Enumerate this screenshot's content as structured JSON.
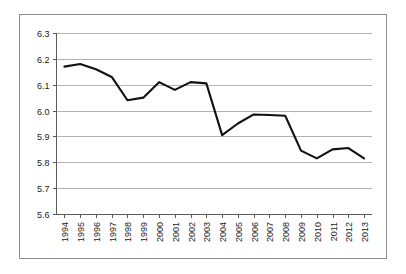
{
  "chart_data": {
    "type": "line",
    "title": "",
    "subtitle": "",
    "xlabel": "",
    "ylabel": "",
    "categories": [
      "1994",
      "1995",
      "1996",
      "1997",
      "1998",
      "1999",
      "2000",
      "2001",
      "2002",
      "2003",
      "2004",
      "2005",
      "2006",
      "2007",
      "2008",
      "2009",
      "2010",
      "2011",
      "2012",
      "2013"
    ],
    "values": [
      6.17,
      6.18,
      6.16,
      6.13,
      6.04,
      6.05,
      6.11,
      6.08,
      6.11,
      6.105,
      5.905,
      5.95,
      5.985,
      5.983,
      5.98,
      5.845,
      5.815,
      5.85,
      5.855,
      5.815
    ],
    "series": [
      {
        "name": "series-1",
        "color": "#111111",
        "values": [
          6.17,
          6.18,
          6.16,
          6.13,
          6.04,
          6.05,
          6.11,
          6.08,
          6.11,
          6.105,
          5.905,
          5.95,
          5.985,
          5.983,
          5.98,
          5.845,
          5.815,
          5.85,
          5.855,
          5.815
        ]
      }
    ],
    "ylim": [
      5.6,
      6.3
    ],
    "ytick_values": [
      6.3,
      6.2,
      6.1,
      6.0,
      5.9,
      5.8,
      5.7,
      5.6
    ],
    "ytick_labels": [
      "6.3",
      "6.2",
      "6.1",
      "6.0",
      "5.9",
      "5.8",
      "5.7",
      "5.6"
    ],
    "xtick_labels": [
      "1994",
      "1995",
      "1996",
      "1997",
      "1998",
      "1999",
      "2000",
      "2001",
      "2002",
      "2003",
      "2004",
      "2005",
      "2006",
      "2007",
      "2008",
      "2009",
      "2010",
      "2011",
      "2012",
      "2013"
    ],
    "xtick_rotation": -90,
    "grid": "horizontal",
    "legend": "none",
    "annotations": [],
    "colors": {
      "line": "#111111",
      "grid": "#b4b4b4",
      "axis": "#5a5a5a",
      "frame": "#8d8d8d",
      "background": "#ffffff",
      "text": "#1b1b1b"
    }
  }
}
